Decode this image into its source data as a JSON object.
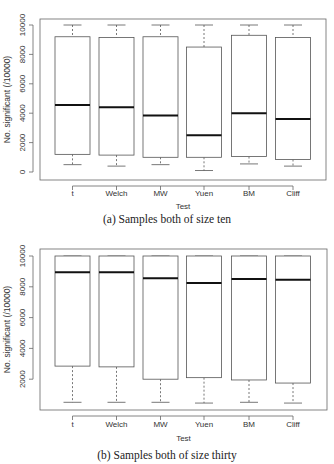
{
  "chart_data": [
    {
      "type": "box",
      "title": "",
      "caption": "(a) Samples both of size ten",
      "xlabel": "Test",
      "ylabel": "No. significant (/10000)",
      "ylim": [
        0,
        10000
      ],
      "yticks": [
        0,
        2000,
        4000,
        6000,
        8000,
        10000
      ],
      "categories": [
        "t",
        "Welch",
        "MW",
        "Yuen",
        "BM",
        "Cliff"
      ],
      "grid": false,
      "series": [
        {
          "name": "t",
          "whisker_low": 500,
          "q1": 1200,
          "median": 4550,
          "q3": 9200,
          "whisker_high": 10000
        },
        {
          "name": "Welch",
          "whisker_low": 400,
          "q1": 1150,
          "median": 4400,
          "q3": 9150,
          "whisker_high": 10000
        },
        {
          "name": "MW",
          "whisker_low": 500,
          "q1": 1000,
          "median": 3850,
          "q3": 9200,
          "whisker_high": 10000
        },
        {
          "name": "Yuen",
          "whisker_low": 100,
          "q1": 1000,
          "median": 2500,
          "q3": 8500,
          "whisker_high": 10000
        },
        {
          "name": "BM",
          "whisker_low": 550,
          "q1": 1050,
          "median": 4000,
          "q3": 9300,
          "whisker_high": 10000
        },
        {
          "name": "Cliff",
          "whisker_low": 400,
          "q1": 850,
          "median": 3600,
          "q3": 9150,
          "whisker_high": 10000
        }
      ]
    },
    {
      "type": "box",
      "title": "",
      "caption": "(b) Samples both of size thirty",
      "xlabel": "Test",
      "ylabel": "No. significant (/10000)",
      "ylim": [
        0,
        10000
      ],
      "yticks": [
        2000,
        4000,
        6000,
        8000,
        10000
      ],
      "categories": [
        "t",
        "Welch",
        "MW",
        "Yuen",
        "BM",
        "Cliff"
      ],
      "grid": false,
      "series": [
        {
          "name": "t",
          "whisker_low": 500,
          "q1": 2850,
          "median": 8950,
          "q3": 10000,
          "whisker_high": 10000
        },
        {
          "name": "Welch",
          "whisker_low": 500,
          "q1": 2800,
          "median": 8950,
          "q3": 10000,
          "whisker_high": 10000
        },
        {
          "name": "MW",
          "whisker_low": 500,
          "q1": 2000,
          "median": 8550,
          "q3": 10000,
          "whisker_high": 10000
        },
        {
          "name": "Yuen",
          "whisker_low": 450,
          "q1": 2100,
          "median": 8250,
          "q3": 10000,
          "whisker_high": 10000
        },
        {
          "name": "BM",
          "whisker_low": 500,
          "q1": 1950,
          "median": 8500,
          "q3": 10000,
          "whisker_high": 10000
        },
        {
          "name": "Cliff",
          "whisker_low": 450,
          "q1": 1750,
          "median": 8450,
          "q3": 10000,
          "whisker_high": 10000
        }
      ]
    }
  ],
  "captions": {
    "a": "(a) Samples both of size ten",
    "b": "(b) Samples both of size thirty"
  }
}
